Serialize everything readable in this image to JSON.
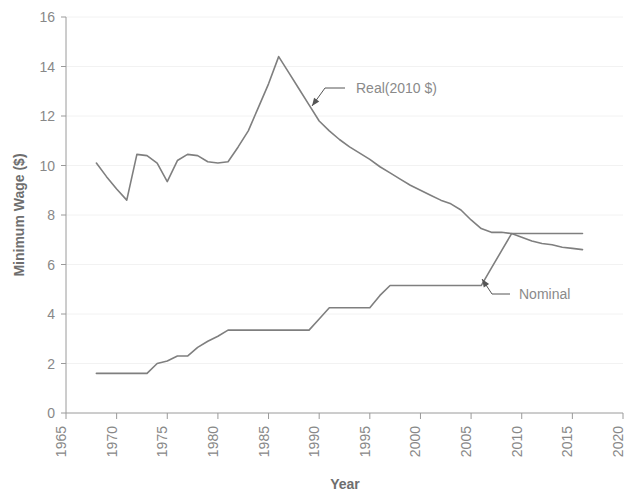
{
  "chart_data": {
    "type": "line",
    "title": "",
    "xlabel": "Year",
    "ylabel": "Minimum Wage ($)",
    "xlim": [
      1965,
      2020
    ],
    "ylim": [
      0,
      16
    ],
    "xticks": [
      1965,
      1970,
      1975,
      1980,
      1985,
      1990,
      1995,
      2000,
      2005,
      2010,
      2015,
      2020
    ],
    "yticks": [
      0,
      2,
      4,
      6,
      8,
      10,
      12,
      14,
      16
    ],
    "grid": "horizontal-faint",
    "legend": "annotations-inline",
    "line_color": "#7f7f7f",
    "series": [
      {
        "name": "Real(2010 $)",
        "x": [
          1968,
          1969,
          1970,
          1971,
          1972,
          1973,
          1974,
          1975,
          1976,
          1977,
          1978,
          1979,
          1980,
          1981,
          1982,
          1983,
          1984,
          1985,
          1986,
          1987,
          1988,
          1989,
          1990,
          1991,
          1992,
          1993,
          1994,
          1995,
          1996,
          1997,
          1998,
          1999,
          2000,
          2001,
          2002,
          2003,
          2004,
          2005,
          2006,
          2007,
          2008,
          2009,
          2010,
          2011,
          2012,
          2013,
          2014,
          2015,
          2016
        ],
        "values": [
          10.1,
          9.55,
          9.05,
          8.6,
          10.45,
          10.4,
          10.1,
          9.35,
          10.2,
          10.45,
          10.4,
          10.15,
          10.1,
          10.15,
          10.75,
          11.4,
          12.35,
          13.3,
          14.4,
          13.75,
          13.1,
          12.45,
          11.8,
          11.4,
          11.05,
          10.75,
          10.5,
          10.25,
          9.95,
          9.7,
          9.45,
          9.2,
          9.0,
          8.8,
          8.6,
          8.45,
          8.2,
          7.8,
          7.45,
          7.3,
          7.3,
          7.25,
          7.1,
          6.95,
          6.85,
          6.8,
          6.7,
          6.65,
          6.6
        ]
      },
      {
        "name": "Nominal",
        "x": [
          1968,
          1969,
          1970,
          1971,
          1972,
          1973,
          1974,
          1975,
          1976,
          1977,
          1978,
          1979,
          1980,
          1981,
          1982,
          1983,
          1984,
          1985,
          1986,
          1987,
          1988,
          1989,
          1990,
          1991,
          1992,
          1993,
          1994,
          1995,
          1996,
          1997,
          1998,
          1999,
          2000,
          2001,
          2002,
          2003,
          2004,
          2005,
          2006,
          2007,
          2008,
          2009,
          2010,
          2011,
          2012,
          2013,
          2014,
          2015,
          2016
        ],
        "values": [
          1.6,
          1.6,
          1.6,
          1.6,
          1.6,
          1.6,
          2.0,
          2.1,
          2.3,
          2.3,
          2.65,
          2.9,
          3.1,
          3.35,
          3.35,
          3.35,
          3.35,
          3.35,
          3.35,
          3.35,
          3.35,
          3.35,
          3.8,
          4.25,
          4.25,
          4.25,
          4.25,
          4.25,
          4.75,
          5.15,
          5.15,
          5.15,
          5.15,
          5.15,
          5.15,
          5.15,
          5.15,
          5.15,
          5.15,
          5.85,
          6.55,
          7.25,
          7.25,
          7.25,
          7.25,
          7.25,
          7.25,
          7.25,
          7.25
        ]
      }
    ],
    "annotations": [
      {
        "label": "Real(2010 $)",
        "text_x": 356,
        "text_y": 93,
        "leader_from_x": 345,
        "leader_from_y": 88,
        "leader_to_x": 325,
        "leader_to_y": 88,
        "arrow_tip_x": 312,
        "arrow_tip_y": 106
      },
      {
        "label": "Nominal",
        "text_x": 519,
        "text_y": 299,
        "leader_from_x": 510,
        "leader_from_y": 294,
        "leader_to_x": 492,
        "leader_to_y": 294,
        "arrow_tip_x": 482,
        "arrow_tip_y": 279
      }
    ]
  },
  "axes": {
    "y_title": "Minimum Wage ($)",
    "x_title": "Year",
    "y_tick_labels": [
      "16",
      "14",
      "12",
      "10",
      "8",
      "6",
      "4",
      "2",
      "0"
    ],
    "x_tick_labels": [
      "1965",
      "1970",
      "1975",
      "1980",
      "1985",
      "1990",
      "1995",
      "2000",
      "2005",
      "2010",
      "2015",
      "2020"
    ]
  },
  "colors": {
    "line": "#7f7f7f",
    "axis": "#9a9a9a",
    "grid": "#f2f2f2",
    "tick_text": "#888888",
    "title_text": "#6e6e6e",
    "annotation_text": "#8a8a8a",
    "background": "#ffffff"
  }
}
